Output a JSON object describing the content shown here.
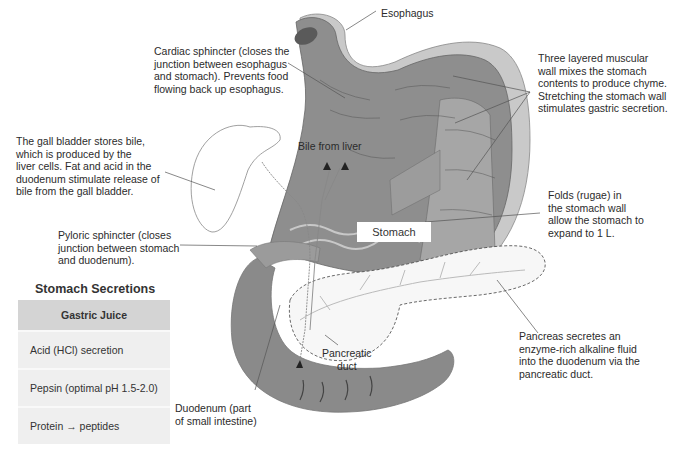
{
  "labels": {
    "esophagus": "Esophagus",
    "cardiac_sphincter": "Cardiac sphincter (closes the\njunction between esophagus\nand stomach). Prevents food\nflowing back up esophagus.",
    "muscular_wall": "Three layered muscular\nwall mixes the stomach\ncontents to produce chyme.\nStretching the stomach wall\nstimulates gastric secretion.",
    "gall_bladder": "The gall bladder stores bile,\nwhich is produced by the\nliver cells. Fat and acid in the\nduodenum stimulate release of\nbile from the gall bladder.",
    "bile_from_liver": "Bile from liver",
    "rugae": "Folds (rugae) in\nthe stomach wall\nallow the stomach to\nexpand to 1 L.",
    "stomach": "Stomach",
    "pyloric_sphincter": "Pyloric sphincter (closes\njunction between stomach\nand duodenum).",
    "pancreas": "Pancreas secretes an\nenzyme-rich alkaline fluid\ninto the duodenum via the\npancreatic duct.",
    "pancreatic_duct": "Pancreatic\nduct",
    "duodenum": "Duodenum (part\nof small intestine)"
  },
  "secretions_table": {
    "title": "Stomach Secretions",
    "header": "Gastric Juice",
    "rows": [
      "Acid (HCl) secretion",
      "Pepsin (optimal pH 1.5-2.0)",
      "Protein → peptides"
    ]
  },
  "colors": {
    "stomach_dark": "#7a7a7a",
    "stomach_mid": "#9a9a9a",
    "outer_wall": "#c8c8c8",
    "table_header": "#d4d4d4",
    "table_row": "#efefef"
  }
}
